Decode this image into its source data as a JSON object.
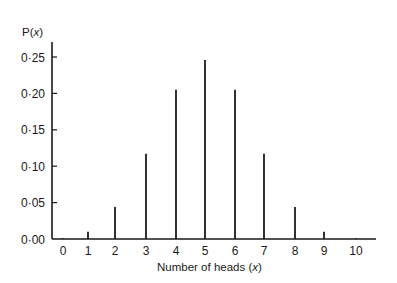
{
  "chart_data": {
    "type": "bar",
    "title": "",
    "xlabel": "Number of heads (x)",
    "ylabel": "P(x)",
    "categories": [
      "0",
      "1",
      "2",
      "3",
      "4",
      "5",
      "6",
      "7",
      "8",
      "9",
      "10"
    ],
    "values": [
      0.001,
      0.01,
      0.044,
      0.117,
      0.205,
      0.246,
      0.205,
      0.117,
      0.044,
      0.01,
      0.001
    ],
    "ylim": [
      0,
      0.27
    ],
    "yticks": [
      0.0,
      0.05,
      0.1,
      0.15,
      0.2,
      0.25
    ],
    "ytick_labels": [
      "0·00",
      "0·05",
      "0·10",
      "0·15",
      "0·20",
      "0·25"
    ],
    "grid": false,
    "legend": null,
    "bar_style": "thin vertical lines (spike plot)"
  },
  "labels": {
    "y_axis_title": "P(",
    "y_axis_var": "x",
    "y_axis_close": ")",
    "x_axis_title": "Number of heads (",
    "x_axis_var": "x",
    "x_axis_close": ")"
  },
  "colors": {
    "ink": "#1a1a1a",
    "background": "#ffffff"
  }
}
